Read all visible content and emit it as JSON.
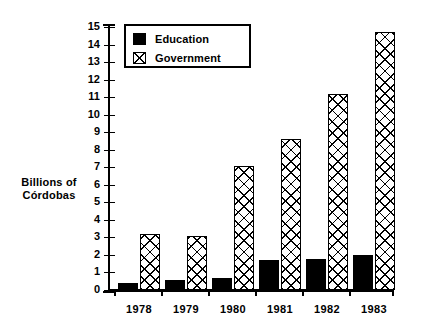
{
  "chart_data": {
    "type": "bar",
    "title": "",
    "xlabel": "",
    "ylabel": "Billions of Córdobas",
    "ylabel_line1": "Billions of",
    "ylabel_line2": "Córdobas",
    "categories": [
      "1978",
      "1979",
      "1980",
      "1981",
      "1982",
      "1983"
    ],
    "series": [
      {
        "name": "Education",
        "values": [
          0.4,
          0.55,
          0.7,
          1.7,
          1.75,
          2.0
        ],
        "color": "#000000",
        "pattern": "solid"
      },
      {
        "name": "Government",
        "values": [
          3.2,
          3.1,
          7.1,
          8.6,
          11.2,
          14.7
        ],
        "color": "#000000",
        "pattern": "crosshatch"
      }
    ],
    "ylim": [
      0,
      15
    ],
    "ytick_labels": [
      "0",
      "1",
      "2",
      "3",
      "4",
      "5",
      "6",
      "7",
      "8",
      "9",
      "10",
      "11",
      "12",
      "13",
      "14",
      "15"
    ],
    "ytick_step": 1,
    "grid": false,
    "legend_position": "top-left",
    "legend_entries": [
      "Education",
      "Government"
    ]
  },
  "legend": {
    "items": [
      {
        "label": "Education",
        "swatch": "solid-black-square"
      },
      {
        "label": "Government",
        "swatch": "crosshatched-square"
      }
    ]
  }
}
